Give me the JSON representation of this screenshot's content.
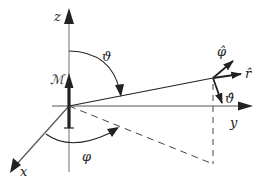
{
  "diagram": {
    "colors": {
      "axis": "#777777",
      "vector": "#222222",
      "dashed": "#444444",
      "text": "#222222",
      "background": "#ffffff"
    },
    "axes": {
      "z": {
        "label": "z"
      },
      "y": {
        "label": "y"
      },
      "x": {
        "label": "x"
      }
    },
    "moment": {
      "label": "ℳ"
    },
    "angles": {
      "theta": {
        "label": "ϑ"
      },
      "phi": {
        "label": "φ"
      }
    },
    "unit_vectors": {
      "r_hat": {
        "label": "r̂"
      },
      "phi_hat": {
        "label": "φ̂"
      },
      "theta_hat": {
        "label": "ϑ̂"
      }
    }
  }
}
